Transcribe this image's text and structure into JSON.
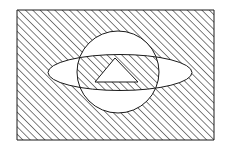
{
  "canvas": {
    "width": 226,
    "height": 153,
    "background_color": "#ffffff"
  },
  "figure": {
    "fill_rule": "evenodd",
    "stroke_color": "#1a1a1a",
    "stroke_width": 1,
    "hatch": {
      "name": "diagonal-hatch-pattern",
      "direction": "backslash",
      "angle_degrees": -45,
      "spacing_px": 5.2,
      "line_width_px": 1.1,
      "line_color": "#1a1a1a",
      "background_color": "#ffffff"
    },
    "shapes": [
      {
        "name": "outer-rectangle",
        "type": "rect",
        "x": 17,
        "y": 10,
        "width": 197,
        "height": 130,
        "hatched": true
      },
      {
        "name": "planet-circle",
        "type": "circle",
        "cx": 118,
        "cy": 72,
        "r": 41,
        "hatched": false
      },
      {
        "name": "ring-ellipse",
        "type": "ellipse",
        "cx": 120,
        "cy": 72.5,
        "rx": 72,
        "ry": 18,
        "hatched": false
      },
      {
        "name": "inner-triangle",
        "type": "polygon",
        "points": "115,58 138,82 95,82",
        "hatched": false
      }
    ]
  }
}
